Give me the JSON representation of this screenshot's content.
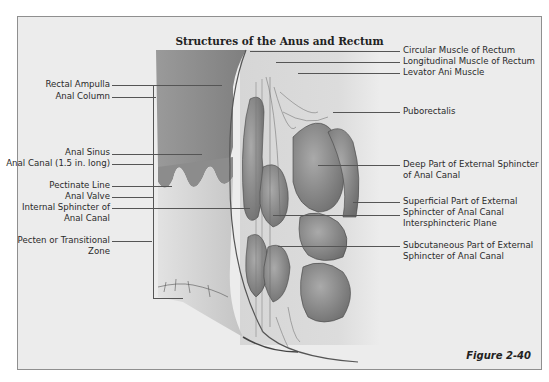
{
  "figure": {
    "title": "Structures of the Anus and Rectum",
    "caption": "Figure 2-40",
    "left_labels": [
      {
        "text": "Rectal Ampulla"
      },
      {
        "text": "Anal Column"
      },
      {
        "text": "Anal Sinus"
      },
      {
        "text": "Anal Canal (1.5 in. long)"
      },
      {
        "text": "Pectinate Line"
      },
      {
        "text": "Anal Valve"
      },
      {
        "text": "Internal Sphincter of"
      },
      {
        "text": "Anal Canal"
      },
      {
        "text": "Pecten or Transitional"
      },
      {
        "text": "Zone"
      }
    ],
    "right_labels": [
      {
        "text": "Circular Muscle of Rectum"
      },
      {
        "text": "Longitudinal Muscle of Rectum"
      },
      {
        "text": "Levator Ani Muscle"
      },
      {
        "text": "Puborectalis"
      },
      {
        "text": "Deep Part of External Sphincter"
      },
      {
        "text": "of Anal Canal"
      },
      {
        "text": "Superficial Part of External"
      },
      {
        "text": "Sphincter of Anal Canal"
      },
      {
        "text": "Intersphincteric Plane"
      },
      {
        "text": "Subcutaneous Part of External"
      },
      {
        "text": "Sphincter of Anal Canal"
      }
    ],
    "colors": {
      "frame_bg": "#ececec",
      "frame_border": "#8f8f8f",
      "mucosa_dark": "#8d8d8d",
      "canal_light": "#d8d8d8",
      "muscle": "#8a8a8a"
    }
  }
}
